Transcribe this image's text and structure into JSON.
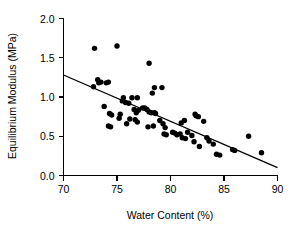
{
  "chart_data": {
    "type": "scatter",
    "title": "",
    "xlabel": "Water Content (%)",
    "ylabel": "Equilibrium Modulus (MPa)",
    "xlim": [
      70,
      90
    ],
    "ylim": [
      0.0,
      2.0
    ],
    "xticks": [
      70,
      75,
      80,
      85,
      90
    ],
    "yticks": [
      0.0,
      0.5,
      1.0,
      1.5,
      2.0
    ],
    "xticklabels": [
      "70",
      "75",
      "80",
      "85",
      "90"
    ],
    "yticklabels": [
      "0.0",
      "0.5",
      "1.0",
      "1.5",
      "2.0"
    ],
    "grid": false,
    "legend": null,
    "marker": "filled-circle",
    "marker_color": "#000000",
    "series": [
      {
        "name": "Specimens",
        "points": [
          [
            72.9,
            1.62
          ],
          [
            75.0,
            1.65
          ],
          [
            78.0,
            1.43
          ],
          [
            72.8,
            1.13
          ],
          [
            73.2,
            1.22
          ],
          [
            73.3,
            1.18
          ],
          [
            73.5,
            1.19
          ],
          [
            74.0,
            1.18
          ],
          [
            74.2,
            1.19
          ],
          [
            78.5,
            1.12
          ],
          [
            79.2,
            1.12
          ],
          [
            78.3,
            1.05
          ],
          [
            73.8,
            0.88
          ],
          [
            75.6,
            0.99
          ],
          [
            76.4,
            0.99
          ],
          [
            76.9,
            0.99
          ],
          [
            75.5,
            0.95
          ],
          [
            75.8,
            0.93
          ],
          [
            76.1,
            0.92
          ],
          [
            74.3,
            0.79
          ],
          [
            74.5,
            0.77
          ],
          [
            74.2,
            0.63
          ],
          [
            74.4,
            0.62
          ],
          [
            75.2,
            0.73
          ],
          [
            75.3,
            0.78
          ],
          [
            75.9,
            0.66
          ],
          [
            76.2,
            0.72
          ],
          [
            76.6,
            0.84
          ],
          [
            76.8,
            0.8
          ],
          [
            77.0,
            0.83
          ],
          [
            76.7,
            0.71
          ],
          [
            76.9,
            0.68
          ],
          [
            77.4,
            0.86
          ],
          [
            77.6,
            0.86
          ],
          [
            77.8,
            0.84
          ],
          [
            78.0,
            0.81
          ],
          [
            78.2,
            0.8
          ],
          [
            78.5,
            0.8
          ],
          [
            78.6,
            0.79
          ],
          [
            78.4,
            0.63
          ],
          [
            77.9,
            0.62
          ],
          [
            79.0,
            0.7
          ],
          [
            79.3,
            0.66
          ],
          [
            79.5,
            0.61
          ],
          [
            79.4,
            0.53
          ],
          [
            79.6,
            0.52
          ],
          [
            80.2,
            0.55
          ],
          [
            80.4,
            0.54
          ],
          [
            80.6,
            0.52
          ],
          [
            80.9,
            0.53
          ],
          [
            81.0,
            0.67
          ],
          [
            81.3,
            0.7
          ],
          [
            81.1,
            0.48
          ],
          [
            81.4,
            0.47
          ],
          [
            81.6,
            0.55
          ],
          [
            82.0,
            0.51
          ],
          [
            82.3,
            0.78
          ],
          [
            82.4,
            0.76
          ],
          [
            82.6,
            0.75
          ],
          [
            83.1,
            0.69
          ],
          [
            82.2,
            0.43
          ],
          [
            82.7,
            0.37
          ],
          [
            83.4,
            0.48
          ],
          [
            83.6,
            0.44
          ],
          [
            84.0,
            0.4
          ],
          [
            84.3,
            0.27
          ],
          [
            84.6,
            0.26
          ],
          [
            85.8,
            0.33
          ],
          [
            86.0,
            0.32
          ],
          [
            87.3,
            0.5
          ],
          [
            88.5,
            0.29
          ]
        ]
      }
    ],
    "fit_line": {
      "name": "Linear regression",
      "x_start": 70.0,
      "y_start": 1.28,
      "x_end": 90.0,
      "y_end": 0.1
    }
  }
}
